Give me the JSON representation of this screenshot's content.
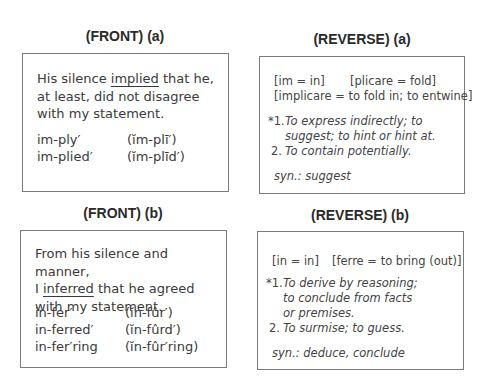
{
  "cards": {
    "front_a": {
      "heading": "(FRONT) (a)",
      "sentence": {
        "before": "His silence ",
        "keyword": "implied",
        "after": " that he, at least, did not disagree with my statement."
      },
      "pronunciations": [
        {
          "word": "im-ply′",
          "pron": "(ĭm-plī′)"
        },
        {
          "word": "im-plied′",
          "pron": "(ĭm-plīd′)"
        }
      ]
    },
    "reverse_a": {
      "heading": "(REVERSE) (a)",
      "etymology": [
        "[im = in]",
        "[plicare = fold]",
        "[implicare = to fold in; to entwine]"
      ],
      "definitions": [
        {
          "num": "*1.",
          "text_line1": "To express indirectly; to",
          "text_line2": "suggest; to hint or hint at."
        },
        {
          "num": "2.",
          "text_line1": "To contain potentially."
        }
      ],
      "synonyms": "syn.: suggest"
    },
    "front_b": {
      "heading": "(FRONT) (b)",
      "sentence": {
        "line1": "From his silence and manner,",
        "before": "I ",
        "keyword": "inferred",
        "after": " that he agreed with my statement."
      },
      "pronunciations": [
        {
          "word": "in-fer′",
          "pron": "(ĭn-fûr′)"
        },
        {
          "word": "in-ferred′",
          "pron": "(ĭn-fûrd′)"
        },
        {
          "word": "in-fer′ring",
          "pron": "(ĭn-fûr′ring)"
        }
      ]
    },
    "reverse_b": {
      "heading": "(REVERSE) (b)",
      "etymology": [
        "[in = in]",
        "[ferre = to bring (out)]"
      ],
      "definitions": [
        {
          "num": "*1.",
          "text_line1": "To derive by reasoning;",
          "text_line2": "to conclude from facts",
          "text_line3": "or premises."
        },
        {
          "num": "2.",
          "text_line1": "To surmise; to guess."
        }
      ],
      "synonyms": "syn.: deduce, conclude"
    }
  }
}
